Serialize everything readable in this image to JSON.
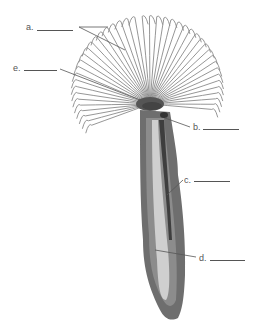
{
  "diagram": {
    "labels": [
      {
        "id": "a",
        "text": "a.",
        "blank": "________",
        "target": "tentacles (radioles)"
      },
      {
        "id": "b",
        "text": "b.",
        "blank": "________",
        "target": "mouth / opening at crown"
      },
      {
        "id": "c",
        "text": "c.",
        "blank": "________",
        "target": "tube wall"
      },
      {
        "id": "d",
        "text": "d.",
        "blank": "________",
        "target": "body inside tube"
      },
      {
        "id": "e",
        "text": "e.",
        "blank": "________",
        "target": "tentacle crown"
      }
    ]
  },
  "colors": {
    "background": "#ffffff",
    "line": "#555555",
    "tentacle": "#8a8a8a",
    "tube_outer": "#7a7a7a",
    "tube_inner": "#c9c9c9",
    "tube_dark": "#3e3e3e"
  }
}
